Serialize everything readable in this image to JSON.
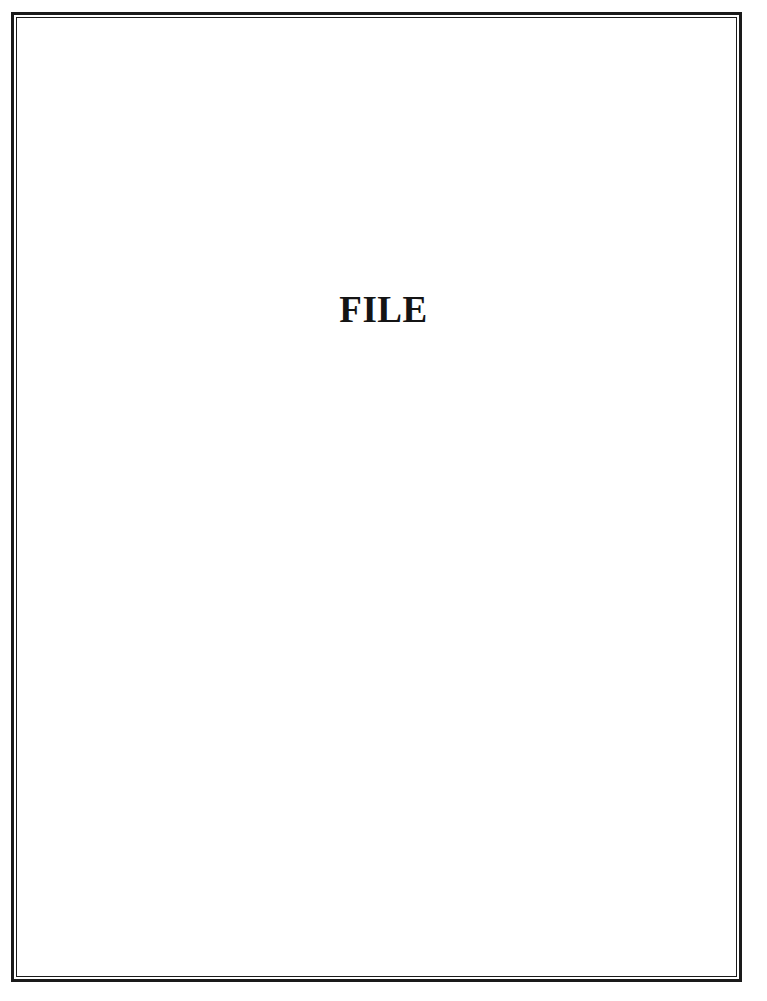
{
  "page": {
    "title": "FILE"
  },
  "colors": {
    "border": "#1a1a1a",
    "text": "#141414",
    "background": "#ffffff"
  }
}
